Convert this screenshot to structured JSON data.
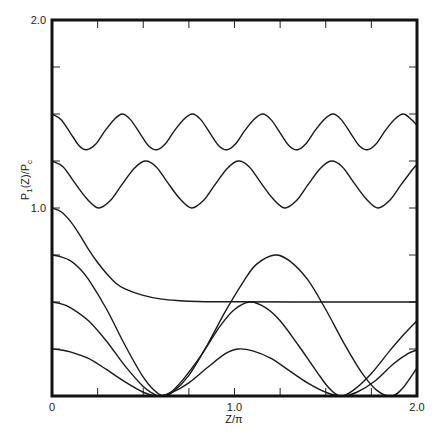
{
  "chart_data": {
    "type": "line",
    "title": "",
    "xlabel": "Z/π",
    "ylabel": {
      "main": "P",
      "sub1": "1",
      "mid": "(Z)/P",
      "sub2": "c"
    },
    "xlim": [
      0,
      2.0
    ],
    "ylim": [
      0,
      2.0
    ],
    "x_tick_step": 0.25,
    "y_tick_step": 0.25,
    "x_tick_labels": [
      {
        "value": 0,
        "label": "0"
      },
      {
        "value": 1.0,
        "label": "1.0"
      },
      {
        "value": 2.0,
        "label": "2.0"
      }
    ],
    "y_tick_labels": [
      {
        "value": 1.0,
        "label": "1.0"
      },
      {
        "value": 2.0,
        "label": "2.0"
      }
    ],
    "grid": false,
    "legend": "none",
    "series": [
      {
        "name": "curve-1",
        "points": [
          [
            0,
            1.5
          ],
          [
            0.05,
            1.47
          ],
          [
            0.1,
            1.4
          ],
          [
            0.15,
            1.33
          ],
          [
            0.19,
            1.31
          ],
          [
            0.24,
            1.34
          ],
          [
            0.29,
            1.41
          ],
          [
            0.34,
            1.47
          ],
          [
            0.385,
            1.5
          ],
          [
            0.43,
            1.47
          ],
          [
            0.48,
            1.4
          ],
          [
            0.53,
            1.33
          ],
          [
            0.575,
            1.31
          ],
          [
            0.62,
            1.34
          ],
          [
            0.67,
            1.41
          ],
          [
            0.72,
            1.47
          ],
          [
            0.77,
            1.5
          ],
          [
            0.815,
            1.47
          ],
          [
            0.865,
            1.4
          ],
          [
            0.915,
            1.33
          ],
          [
            0.96,
            1.31
          ],
          [
            1.005,
            1.34
          ],
          [
            1.055,
            1.41
          ],
          [
            1.105,
            1.47
          ],
          [
            1.155,
            1.5
          ],
          [
            1.2,
            1.47
          ],
          [
            1.25,
            1.4
          ],
          [
            1.3,
            1.33
          ],
          [
            1.345,
            1.31
          ],
          [
            1.39,
            1.34
          ],
          [
            1.44,
            1.41
          ],
          [
            1.49,
            1.47
          ],
          [
            1.54,
            1.5
          ],
          [
            1.585,
            1.47
          ],
          [
            1.635,
            1.4
          ],
          [
            1.685,
            1.33
          ],
          [
            1.73,
            1.31
          ],
          [
            1.775,
            1.34
          ],
          [
            1.825,
            1.41
          ],
          [
            1.875,
            1.47
          ],
          [
            1.925,
            1.5
          ],
          [
            1.97,
            1.47
          ],
          [
            2.0,
            1.44
          ]
        ]
      },
      {
        "name": "curve-2",
        "points": [
          [
            0,
            1.25
          ],
          [
            0.06,
            1.22
          ],
          [
            0.12,
            1.14
          ],
          [
            0.19,
            1.05
          ],
          [
            0.255,
            1.0
          ],
          [
            0.32,
            1.04
          ],
          [
            0.38,
            1.12
          ],
          [
            0.45,
            1.21
          ],
          [
            0.51,
            1.25
          ],
          [
            0.57,
            1.22
          ],
          [
            0.63,
            1.14
          ],
          [
            0.7,
            1.05
          ],
          [
            0.765,
            1.0
          ],
          [
            0.83,
            1.04
          ],
          [
            0.89,
            1.12
          ],
          [
            0.96,
            1.21
          ],
          [
            1.02,
            1.25
          ],
          [
            1.08,
            1.22
          ],
          [
            1.14,
            1.14
          ],
          [
            1.21,
            1.05
          ],
          [
            1.275,
            1.0
          ],
          [
            1.34,
            1.04
          ],
          [
            1.4,
            1.12
          ],
          [
            1.47,
            1.21
          ],
          [
            1.53,
            1.25
          ],
          [
            1.59,
            1.22
          ],
          [
            1.65,
            1.14
          ],
          [
            1.72,
            1.05
          ],
          [
            1.785,
            1.0
          ],
          [
            1.85,
            1.04
          ],
          [
            1.91,
            1.12
          ],
          [
            1.98,
            1.21
          ],
          [
            2.0,
            1.23
          ]
        ]
      },
      {
        "name": "curve-3",
        "points": [
          [
            0,
            1.0
          ],
          [
            0.05,
            0.98
          ],
          [
            0.1,
            0.93
          ],
          [
            0.15,
            0.86
          ],
          [
            0.2,
            0.78
          ],
          [
            0.25,
            0.71
          ],
          [
            0.3,
            0.65
          ],
          [
            0.35,
            0.6
          ],
          [
            0.4,
            0.57
          ],
          [
            0.5,
            0.535
          ],
          [
            0.6,
            0.515
          ],
          [
            0.7,
            0.507
          ],
          [
            0.8,
            0.503
          ],
          [
            1.0,
            0.501
          ],
          [
            1.5,
            0.5
          ],
          [
            2.0,
            0.5
          ]
        ]
      },
      {
        "name": "curve-4",
        "points": [
          [
            0,
            0.75
          ],
          [
            0.05,
            0.74
          ],
          [
            0.1,
            0.72
          ],
          [
            0.15,
            0.68
          ],
          [
            0.2,
            0.62
          ],
          [
            0.3,
            0.46
          ],
          [
            0.4,
            0.27
          ],
          [
            0.5,
            0.1
          ],
          [
            0.56,
            0.03
          ],
          [
            0.61,
            0.0
          ],
          [
            0.66,
            0.02
          ],
          [
            0.75,
            0.11
          ],
          [
            0.85,
            0.27
          ],
          [
            0.95,
            0.45
          ],
          [
            1.05,
            0.61
          ],
          [
            1.12,
            0.7
          ],
          [
            1.22,
            0.75
          ],
          [
            1.3,
            0.72
          ],
          [
            1.4,
            0.62
          ],
          [
            1.5,
            0.46
          ],
          [
            1.6,
            0.28
          ],
          [
            1.7,
            0.12
          ],
          [
            1.78,
            0.03
          ],
          [
            1.86,
            0.0
          ],
          [
            1.92,
            0.04
          ],
          [
            2.0,
            0.15
          ]
        ]
      },
      {
        "name": "curve-5",
        "points": [
          [
            0,
            0.5
          ],
          [
            0.05,
            0.49
          ],
          [
            0.1,
            0.47
          ],
          [
            0.2,
            0.4
          ],
          [
            0.3,
            0.29
          ],
          [
            0.4,
            0.16
          ],
          [
            0.5,
            0.05
          ],
          [
            0.55,
            0.015
          ],
          [
            0.59,
            0.0
          ],
          [
            0.65,
            0.02
          ],
          [
            0.72,
            0.09
          ],
          [
            0.82,
            0.22
          ],
          [
            0.92,
            0.37
          ],
          [
            1.0,
            0.46
          ],
          [
            1.085,
            0.5
          ],
          [
            1.17,
            0.47
          ],
          [
            1.25,
            0.4
          ],
          [
            1.35,
            0.27
          ],
          [
            1.45,
            0.13
          ],
          [
            1.52,
            0.04
          ],
          [
            1.58,
            0.0
          ],
          [
            1.65,
            0.03
          ],
          [
            1.75,
            0.12
          ],
          [
            1.85,
            0.24
          ],
          [
            1.93,
            0.33
          ],
          [
            2.0,
            0.4
          ]
        ]
      },
      {
        "name": "curve-6",
        "points": [
          [
            0,
            0.25
          ],
          [
            0.05,
            0.245
          ],
          [
            0.1,
            0.235
          ],
          [
            0.2,
            0.2
          ],
          [
            0.3,
            0.14
          ],
          [
            0.4,
            0.075
          ],
          [
            0.5,
            0.02
          ],
          [
            0.58,
            0.0
          ],
          [
            0.65,
            0.015
          ],
          [
            0.75,
            0.07
          ],
          [
            0.85,
            0.15
          ],
          [
            0.95,
            0.225
          ],
          [
            1.02,
            0.25
          ],
          [
            1.1,
            0.24
          ],
          [
            1.2,
            0.2
          ],
          [
            1.3,
            0.135
          ],
          [
            1.4,
            0.07
          ],
          [
            1.5,
            0.02
          ],
          [
            1.59,
            0.0
          ],
          [
            1.67,
            0.02
          ],
          [
            1.77,
            0.08
          ],
          [
            1.87,
            0.17
          ],
          [
            1.95,
            0.225
          ],
          [
            2.0,
            0.245
          ]
        ]
      }
    ]
  }
}
